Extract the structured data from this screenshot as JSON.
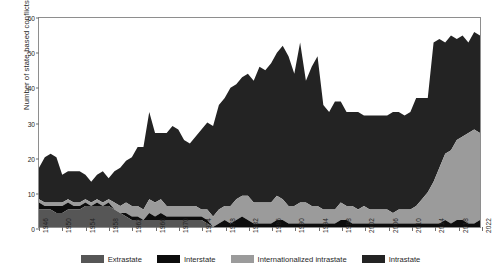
{
  "chart_data": {
    "type": "area",
    "stacked": true,
    "title": "",
    "xlabel": "",
    "ylabel": "Number of state-based conflicts",
    "ylim": [
      0,
      60
    ],
    "yticks": [
      0,
      10,
      20,
      30,
      40,
      50,
      60
    ],
    "xlim": [
      1946,
      2022
    ],
    "xticks": [
      1946,
      1950,
      1954,
      1958,
      1962,
      1966,
      1970,
      1974,
      1978,
      1982,
      1986,
      1990,
      1994,
      1998,
      2002,
      2006,
      2010,
      2014,
      2018,
      2022
    ],
    "grid": false,
    "legend_position": "bottom",
    "x": [
      1946,
      1947,
      1948,
      1949,
      1950,
      1951,
      1952,
      1953,
      1954,
      1955,
      1956,
      1957,
      1958,
      1959,
      1960,
      1961,
      1962,
      1963,
      1964,
      1965,
      1966,
      1967,
      1968,
      1969,
      1970,
      1971,
      1972,
      1973,
      1974,
      1975,
      1976,
      1977,
      1978,
      1979,
      1980,
      1981,
      1982,
      1983,
      1984,
      1985,
      1986,
      1987,
      1988,
      1989,
      1990,
      1991,
      1992,
      1993,
      1994,
      1995,
      1996,
      1997,
      1998,
      1999,
      2000,
      2001,
      2002,
      2003,
      2004,
      2005,
      2006,
      2007,
      2008,
      2009,
      2010,
      2011,
      2012,
      2013,
      2014,
      2015,
      2016,
      2017,
      2018,
      2019,
      2020,
      2021,
      2022
    ],
    "series": [
      {
        "name": "Extrastate",
        "color": "#565656",
        "values": [
          5,
          5,
          5,
          4,
          4,
          5,
          5,
          5,
          6,
          6,
          6,
          6,
          6,
          5,
          4,
          3,
          2,
          2,
          2,
          2,
          2,
          2,
          2,
          2,
          2,
          2,
          2,
          2,
          2,
          1,
          0,
          0,
          0,
          0,
          0,
          0,
          0,
          0,
          0,
          0,
          0,
          0,
          0,
          0,
          0,
          0,
          0,
          0,
          0,
          0,
          0,
          0,
          0,
          0,
          0,
          0,
          0,
          0,
          0,
          0,
          0,
          0,
          0,
          0,
          0,
          0,
          0,
          0,
          0,
          0,
          0,
          0,
          0,
          0,
          0,
          0,
          0
        ]
      },
      {
        "name": "Interstate",
        "color": "#0d0d0d",
        "values": [
          2,
          1,
          1,
          2,
          2,
          2,
          1,
          1,
          1,
          0,
          1,
          0,
          1,
          0,
          0,
          1,
          1,
          1,
          0,
          2,
          1,
          2,
          1,
          1,
          1,
          1,
          1,
          1,
          1,
          1,
          0,
          1,
          2,
          1,
          2,
          3,
          2,
          1,
          1,
          1,
          1,
          2,
          2,
          1,
          1,
          1,
          1,
          1,
          1,
          1,
          1,
          1,
          2,
          2,
          1,
          1,
          1,
          1,
          1,
          1,
          1,
          1,
          1,
          1,
          1,
          1,
          1,
          1,
          1,
          1,
          2,
          1,
          2,
          2,
          1,
          1,
          2
        ]
      },
      {
        "name": "Internationalized intrastate",
        "color": "#9b9b9b",
        "values": [
          1,
          1,
          1,
          1,
          1,
          1,
          1,
          1,
          1,
          1,
          1,
          1,
          1,
          2,
          2,
          3,
          3,
          3,
          3,
          4,
          4,
          4,
          3,
          3,
          3,
          3,
          3,
          3,
          2,
          3,
          3,
          4,
          4,
          5,
          6,
          6,
          7,
          6,
          6,
          6,
          6,
          7,
          6,
          5,
          5,
          6,
          6,
          5,
          5,
          4,
          4,
          4,
          5,
          4,
          5,
          4,
          5,
          4,
          4,
          4,
          4,
          3,
          4,
          4,
          4,
          5,
          7,
          9,
          12,
          16,
          19,
          21,
          23,
          24,
          26,
          27,
          25
        ]
      },
      {
        "name": "Intrastate",
        "color": "#232323",
        "values": [
          9,
          13,
          14,
          13,
          8,
          8,
          9,
          9,
          7,
          6,
          7,
          9,
          6,
          9,
          11,
          12,
          14,
          17,
          18,
          25,
          20,
          19,
          21,
          23,
          22,
          19,
          18,
          20,
          23,
          25,
          26,
          30,
          31,
          34,
          33,
          34,
          35,
          35,
          39,
          38,
          40,
          41,
          44,
          43,
          38,
          46,
          35,
          40,
          43,
          30,
          28,
          31,
          29,
          27,
          27,
          28,
          26,
          27,
          27,
          27,
          27,
          29,
          28,
          27,
          28,
          31,
          29,
          27,
          40,
          37,
          32,
          33,
          29,
          29,
          26,
          28,
          28
        ]
      }
    ],
    "totals": [
      17,
      20,
      21,
      20,
      15,
      16,
      16,
      16,
      15,
      13,
      15,
      16,
      14,
      16,
      17,
      19,
      20,
      23,
      23,
      33,
      27,
      27,
      27,
      29,
      28,
      25,
      24,
      26,
      28,
      30,
      29,
      35,
      37,
      40,
      41,
      43,
      44,
      42,
      46,
      45,
      47,
      50,
      52,
      49,
      44,
      53,
      42,
      46,
      49,
      35,
      33,
      36,
      36,
      33,
      33,
      33,
      32,
      32,
      32,
      32,
      32,
      33,
      33,
      32,
      33,
      37,
      37,
      37,
      53,
      54,
      53,
      55,
      54,
      55,
      53,
      56,
      55
    ]
  },
  "legend": {
    "items": [
      {
        "label": "Extrastate",
        "color": "#565656"
      },
      {
        "label": "Interstate",
        "color": "#0d0d0d"
      },
      {
        "label": "Internationalized intrastate",
        "color": "#9b9b9b"
      },
      {
        "label": "Intrastate",
        "color": "#232323"
      }
    ]
  }
}
